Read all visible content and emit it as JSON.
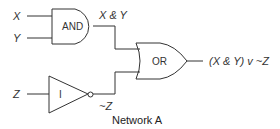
{
  "diagram": {
    "caption": "Network A",
    "inputs": {
      "x": "X",
      "y": "Y",
      "z": "Z"
    },
    "gates": {
      "and": {
        "label": "AND"
      },
      "not": {
        "label": "I"
      },
      "or": {
        "label": "OR"
      }
    },
    "wires": {
      "and_out": "X & Y",
      "not_out": "~Z",
      "or_out": "(X & Y) v ~Z"
    },
    "colors": {
      "stroke": "#333333",
      "background": "#ffffff"
    }
  }
}
